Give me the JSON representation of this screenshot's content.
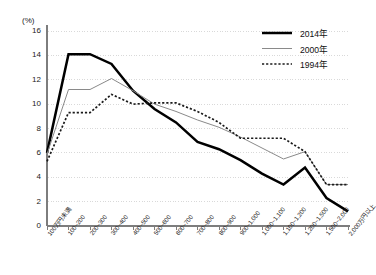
{
  "chart_data": {
    "type": "line",
    "title": "",
    "xlabel": "",
    "ylabel": "(%)",
    "ylim": [
      0,
      16
    ],
    "ytick_step": 2,
    "grid": true,
    "grid_style": "dotted-horizontal",
    "legend_position": "top-right",
    "categories": [
      "100万円未満",
      "100~200",
      "200~300",
      "300~400",
      "400~500",
      "500~600",
      "600~700",
      "700~800",
      "800~900",
      "900~1,000",
      "1,000~1,100",
      "1,100~1,200",
      "1,200~1,500",
      "1,500~2,000",
      "2,000万円以上"
    ],
    "ytick_labels": [
      "0",
      "2",
      "4",
      "6",
      "8",
      "10",
      "12",
      "14",
      "16"
    ],
    "series": [
      {
        "name": "2014年",
        "style": "solid-thick",
        "color": "#000000",
        "values": [
          6.0,
          14.1,
          14.1,
          13.3,
          11.1,
          9.6,
          8.5,
          6.9,
          6.3,
          5.4,
          4.3,
          3.4,
          4.8,
          2.3,
          1.2
        ]
      },
      {
        "name": "2000年",
        "style": "solid-thin",
        "color": "#8a8a8a",
        "values": [
          5.9,
          11.2,
          11.2,
          12.1,
          11.1,
          10.0,
          9.4,
          8.7,
          8.1,
          7.3,
          6.4,
          5.5,
          6.1,
          3.4,
          3.4
        ]
      },
      {
        "name": "1994年",
        "style": "dotted",
        "color": "#1a1a1a",
        "values": [
          5.3,
          9.3,
          9.3,
          10.8,
          10.0,
          10.1,
          10.1,
          9.4,
          8.5,
          7.2,
          7.2,
          7.2,
          6.1,
          3.4,
          3.4
        ]
      }
    ]
  },
  "legend": {
    "entries": [
      {
        "label": "2014年"
      },
      {
        "label": "2000年"
      },
      {
        "label": "1994年"
      }
    ]
  },
  "axis": {
    "unit": "(%)"
  }
}
